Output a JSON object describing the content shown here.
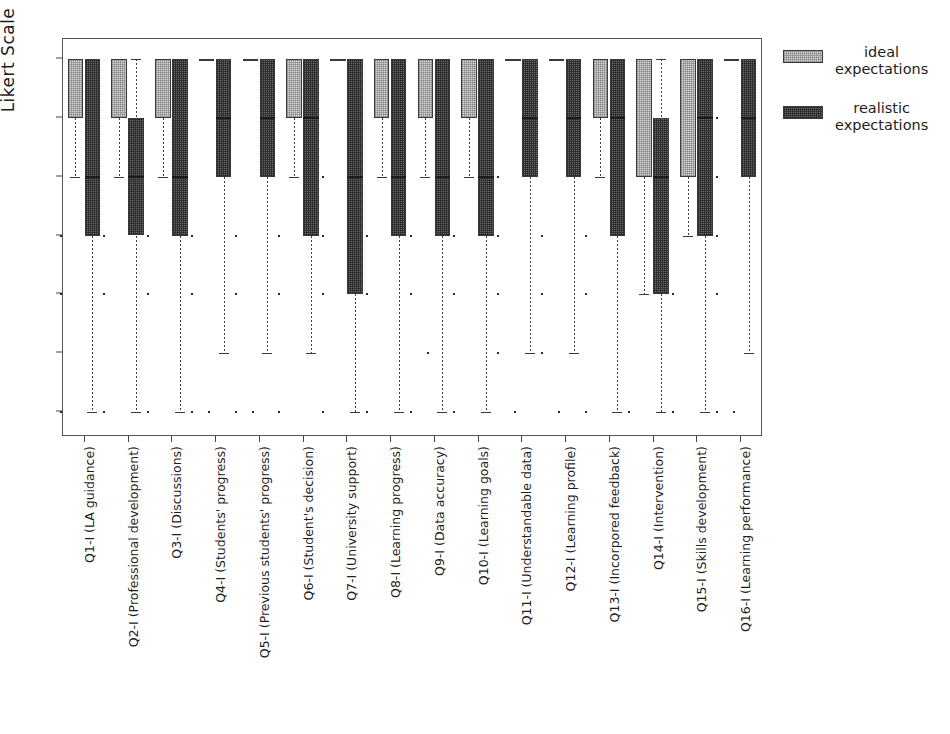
{
  "chart_data": {
    "type": "box",
    "title": "",
    "xlabel": "",
    "ylabel": "Likert Scale",
    "ylim": [
      1,
      7
    ],
    "yticks": [
      7,
      6,
      5,
      4,
      3,
      2,
      1
    ],
    "grid": false,
    "legend_position": "right",
    "legend": [
      {
        "name": "ideal expectations",
        "color": "#d8d8d8",
        "line1": "ideal",
        "line2": "expectations"
      },
      {
        "name": "realistic expectations",
        "color": "#6a6a6a",
        "line1": "realistic",
        "line2": "expectations"
      }
    ],
    "categories": [
      "Q1-I (LA guidance)",
      "Q2-I (Professional development)",
      "Q3-I (Discussions)",
      "Q4-I (Students' progress)",
      "Q5-I (Previous students' progress)",
      "Q6-I (Student's decision)",
      "Q7-I (University support)",
      "Q8-I (Learning progress)",
      "Q9-I (Data accuracy)",
      "Q10-I (Learning goals)",
      "Q11-I (Understandable data)",
      "Q12-I (Learning profile)",
      "Q13-I (Incorpored feedback)",
      "Q14-I (Intervention)",
      "Q15-I (Skills development)",
      "Q16-I (Learning performance)"
    ],
    "series": [
      {
        "name": "ideal expectations",
        "boxes": [
          {
            "q1": 6,
            "median": 7,
            "q3": 7,
            "whisker_low": 5,
            "whisker_high": 7,
            "outliers": [
              4,
              3,
              1
            ]
          },
          {
            "q1": 6,
            "median": 7,
            "q3": 7,
            "whisker_low": 5,
            "whisker_high": 7,
            "outliers": [
              4,
              3,
              1
            ]
          },
          {
            "q1": 6,
            "median": 7,
            "q3": 7,
            "whisker_low": 5,
            "whisker_high": 7,
            "outliers": [
              4,
              3,
              1
            ]
          },
          {
            "q1": 7,
            "median": 7,
            "q3": 7,
            "whisker_low": 7,
            "whisker_high": 7,
            "outliers": [
              4,
              3,
              1
            ]
          },
          {
            "q1": 7,
            "median": 7,
            "q3": 7,
            "whisker_low": 7,
            "whisker_high": 7,
            "outliers": [
              4,
              3,
              1
            ]
          },
          {
            "q1": 6,
            "median": 7,
            "q3": 7,
            "whisker_low": 5,
            "whisker_high": 7,
            "outliers": [
              4,
              3,
              1
            ]
          },
          {
            "q1": 7,
            "median": 7,
            "q3": 7,
            "whisker_low": 7,
            "whisker_high": 7,
            "outliers": [
              5,
              4,
              3,
              1
            ]
          },
          {
            "q1": 6,
            "median": 7,
            "q3": 7,
            "whisker_low": 5,
            "whisker_high": 7,
            "outliers": [
              4,
              3,
              1
            ]
          },
          {
            "q1": 6,
            "median": 7,
            "q3": 7,
            "whisker_low": 5,
            "whisker_high": 7,
            "outliers": [
              4,
              3,
              1
            ]
          },
          {
            "q1": 6,
            "median": 7,
            "q3": 7,
            "whisker_low": 5,
            "whisker_high": 7,
            "outliers": [
              4,
              3,
              1
            ]
          },
          {
            "q1": 7,
            "median": 7,
            "q3": 7,
            "whisker_low": 7,
            "whisker_high": 7,
            "outliers": [
              5,
              4,
              3,
              2
            ]
          },
          {
            "q1": 7,
            "median": 7,
            "q3": 7,
            "whisker_low": 7,
            "whisker_high": 7,
            "outliers": [
              4,
              3,
              2
            ]
          },
          {
            "q1": 6,
            "median": 7,
            "q3": 7,
            "whisker_low": 5,
            "whisker_high": 7,
            "outliers": [
              4,
              3,
              1
            ]
          },
          {
            "q1": 5,
            "median": 7,
            "q3": 7,
            "whisker_low": 3,
            "whisker_high": 7,
            "outliers": [
              1
            ]
          },
          {
            "q1": 5,
            "median": 7,
            "q3": 7,
            "whisker_low": 4,
            "whisker_high": 7,
            "outliers": [
              3,
              1
            ]
          },
          {
            "q1": 7,
            "median": 7,
            "q3": 7,
            "whisker_low": 7,
            "whisker_high": 7,
            "outliers": [
              6,
              5,
              4,
              3,
              1
            ]
          }
        ]
      },
      {
        "name": "realistic expectations",
        "boxes": [
          {
            "q1": 4,
            "median": 5,
            "q3": 7,
            "whisker_low": 1,
            "whisker_high": 7,
            "outliers": []
          },
          {
            "q1": 4,
            "median": 5,
            "q3": 6,
            "whisker_low": 1,
            "whisker_high": 7,
            "outliers": []
          },
          {
            "q1": 4,
            "median": 5,
            "q3": 7,
            "whisker_low": 1,
            "whisker_high": 7,
            "outliers": []
          },
          {
            "q1": 5,
            "median": 6,
            "q3": 7,
            "whisker_low": 2,
            "whisker_high": 7,
            "outliers": [
              1
            ]
          },
          {
            "q1": 5,
            "median": 6,
            "q3": 7,
            "whisker_low": 2,
            "whisker_high": 7,
            "outliers": [
              1
            ]
          },
          {
            "q1": 4,
            "median": 6,
            "q3": 7,
            "whisker_low": 2,
            "whisker_high": 7,
            "outliers": []
          },
          {
            "q1": 3,
            "median": 5,
            "q3": 7,
            "whisker_low": 1,
            "whisker_high": 7,
            "outliers": []
          },
          {
            "q1": 4,
            "median": 5,
            "q3": 7,
            "whisker_low": 1,
            "whisker_high": 7,
            "outliers": []
          },
          {
            "q1": 4,
            "median": 5,
            "q3": 7,
            "whisker_low": 1,
            "whisker_high": 7,
            "outliers": [
              2
            ]
          },
          {
            "q1": 4,
            "median": 5,
            "q3": 7,
            "whisker_low": 1,
            "whisker_high": 7,
            "outliers": []
          },
          {
            "q1": 5,
            "median": 6,
            "q3": 7,
            "whisker_low": 2,
            "whisker_high": 7,
            "outliers": [
              1
            ]
          },
          {
            "q1": 5,
            "median": 6,
            "q3": 7,
            "whisker_low": 2,
            "whisker_high": 7,
            "outliers": [
              1
            ]
          },
          {
            "q1": 4,
            "median": 6,
            "q3": 7,
            "whisker_low": 1,
            "whisker_high": 7,
            "outliers": []
          },
          {
            "q1": 3,
            "median": 5,
            "q3": 6,
            "whisker_low": 1,
            "whisker_high": 7,
            "outliers": []
          },
          {
            "q1": 4,
            "median": 6,
            "q3": 7,
            "whisker_low": 1,
            "whisker_high": 7,
            "outliers": []
          },
          {
            "q1": 5,
            "median": 6,
            "q3": 7,
            "whisker_low": 2,
            "whisker_high": 7,
            "outliers": [
              1
            ]
          }
        ]
      }
    ]
  }
}
